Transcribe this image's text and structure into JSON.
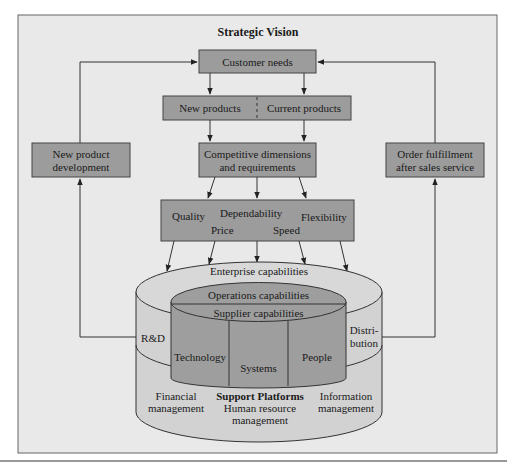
{
  "diagram": {
    "title": "Strategic Vision",
    "colors": {
      "background": "#e9e9e9",
      "frame_border": "#555555",
      "box_fill": "#9c9c9c",
      "box_border": "#444444",
      "cylinder_outer": "#d2d2d2",
      "cylinder_inner": "#9e9e9e",
      "line": "#333333",
      "bottom_rule": "#666666"
    },
    "boxes": {
      "customer_needs": "Customer needs",
      "new_products": "New products",
      "current_products": "Current products",
      "competitive": {
        "line1": "Competitive dimensions",
        "line2": "and requirements"
      },
      "new_product_development": {
        "line1": "New product",
        "line2": "development"
      },
      "order_fulfillment": {
        "line1": "Order fulfillment",
        "line2": "after sales service"
      }
    },
    "dimensions": {
      "quality": "Quality",
      "dependability": "Dependability",
      "flexibility": "Flexibility",
      "price": "Price",
      "speed": "Speed"
    },
    "cylinder": {
      "enterprise": "Enterprise capabilities",
      "operations": "Operations capabilities",
      "supplier": "Supplier capabilities",
      "rnd": "R&D",
      "distribution": {
        "line1": "Distri-",
        "line2": "bution"
      },
      "technology": "Technology",
      "systems": "Systems",
      "people": "People",
      "support_platforms": "Support Platforms",
      "financial": {
        "line1": "Financial",
        "line2": "management"
      },
      "human_resource": {
        "line1": "Human resource",
        "line2": "management"
      },
      "information": {
        "line1": "Information",
        "line2": "management"
      }
    }
  }
}
